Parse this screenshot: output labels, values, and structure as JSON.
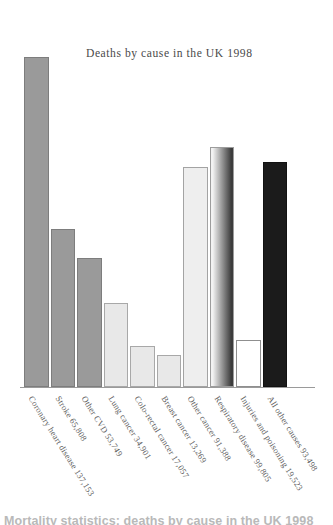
{
  "chart_data": {
    "type": "bar",
    "title": "Deaths by cause in the UK 1998",
    "xlabel": "",
    "ylabel": "",
    "grid": false,
    "legend": "none",
    "ylim": [
      0,
      150000
    ],
    "categories": [
      "Coronary heart disease 137,153",
      "Stroke 65,808",
      "Other CVD 53,749",
      "Lung cancer 34,901",
      "Colo-rectal cancer 17,057",
      "Breast cancer 13,269",
      "Other cancer 91,388",
      "Respiratory disease 99,805",
      "Injuries and poisoning 19,523",
      "All other causes 93,498"
    ],
    "short_labels": [
      "Coronary heart disease",
      "Stroke",
      "Other CVD",
      "Lung cancer",
      "Colo-rectal cancer",
      "Breast cancer",
      "Other cancer",
      "Respiratory disease",
      "Injuries and poisoning",
      "All other causes"
    ],
    "values": [
      137153,
      65808,
      53749,
      34901,
      17057,
      13269,
      91388,
      99805,
      19523,
      93498
    ],
    "value_labels": [
      "137,153",
      "65,808",
      "53,749",
      "34,901",
      "17,057",
      "13,269",
      "91,388",
      "99,805",
      "19,523",
      "93,498"
    ],
    "bar_styles": [
      {
        "name": "coronary-heart-disease",
        "fill": "#9a9a9a",
        "stroke": "#7d7d7d",
        "gradient": false
      },
      {
        "name": "stroke",
        "fill": "#9a9a9a",
        "stroke": "#7d7d7d",
        "gradient": false
      },
      {
        "name": "other-cvd",
        "fill": "#9a9a9a",
        "stroke": "#7d7d7d",
        "gradient": false
      },
      {
        "name": "lung-cancer",
        "fill": "#e8e8e8",
        "stroke": "#a8a8a8",
        "gradient": false
      },
      {
        "name": "colo-rectal-cancer",
        "fill": "#e8e8e8",
        "stroke": "#a8a8a8",
        "gradient": false
      },
      {
        "name": "breast-cancer",
        "fill": "#e8e8e8",
        "stroke": "#a8a8a8",
        "gradient": false
      },
      {
        "name": "other-cancer",
        "fill": "#eeeeee",
        "stroke": "#a3a3a3",
        "gradient": false
      },
      {
        "name": "respiratory-disease",
        "fill": "#bdbdbd",
        "stroke": "#9c9c9c",
        "gradient": true,
        "gradient_from": "#f2f2f2",
        "gradient_to": "#3c3c3c"
      },
      {
        "name": "injuries-and-poisoning",
        "fill": "#ffffff",
        "stroke": "#8f8f8f",
        "gradient": false
      },
      {
        "name": "all-other-causes",
        "fill": "#1b1b1b",
        "stroke": "#121212",
        "gradient": false
      }
    ],
    "axis_color": "#9a9a9a"
  },
  "caption": {
    "text": "Mortality statistics: deaths by cause in the UK 1998"
  }
}
